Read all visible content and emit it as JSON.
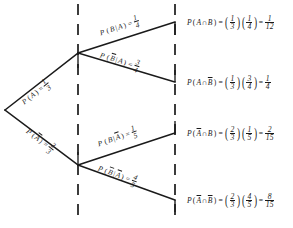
{
  "diagram": {
    "type": "probability-tree",
    "stroke_color": "#1a1a1a",
    "background": "#ffffff",
    "dashed_guides": [
      78,
      175
    ],
    "root": {
      "x": 5,
      "y": 110
    },
    "nodes": [
      {
        "id": "A",
        "x": 78,
        "y": 53
      },
      {
        "id": "Abar",
        "x": 78,
        "y": 165
      }
    ],
    "leaves": [
      {
        "id": "AB",
        "x": 175,
        "y": 22
      },
      {
        "id": "ABbar",
        "x": 175,
        "y": 82
      },
      {
        "id": "AbarB",
        "x": 175,
        "y": 133
      },
      {
        "id": "AbarBbar",
        "x": 175,
        "y": 200
      }
    ]
  },
  "branches": [
    {
      "name": "branch-a",
      "event": "P(A)",
      "event_symbol": "A",
      "complement": false,
      "conditional": false,
      "prob_num": "1",
      "prob_den": "3",
      "angle": -38
    },
    {
      "name": "branch-a-bar",
      "event": "P(Ā)",
      "event_symbol": "A",
      "complement": true,
      "conditional": false,
      "prob_num": "2",
      "prob_den": "3",
      "angle": 37
    },
    {
      "name": "branch-b-given-a",
      "event": "P(B|A)",
      "event_symbol": "B",
      "given": "A",
      "complement": false,
      "given_complement": false,
      "conditional": true,
      "prob_num": "1",
      "prob_den": "4",
      "angle": -18
    },
    {
      "name": "branch-b-bar-given-a",
      "event": "P(B̄|A)",
      "event_symbol": "B",
      "given": "A",
      "complement": true,
      "given_complement": false,
      "conditional": true,
      "prob_num": "3",
      "prob_den": "4",
      "angle": 17
    },
    {
      "name": "branch-b-given-a-bar",
      "event": "P(B|Ā)",
      "event_symbol": "B",
      "given": "A",
      "complement": false,
      "given_complement": true,
      "conditional": true,
      "prob_num": "1",
      "prob_den": "5",
      "angle": -19
    },
    {
      "name": "branch-b-bar-given-a-bar",
      "event": "P(B̄|Ā)",
      "event_symbol": "B",
      "given": "A",
      "complement": true,
      "given_complement": true,
      "conditional": true,
      "prob_num": "4",
      "prob_den": "5",
      "angle": 20
    }
  ],
  "outcomes": [
    {
      "name": "outcome-a-and-b",
      "label": "P(A ∩ B)",
      "first_symbol": "A",
      "first_complement": false,
      "second_symbol": "B",
      "second_complement": false,
      "factor1_num": "1",
      "factor1_den": "3",
      "factor2_num": "1",
      "factor2_den": "4",
      "result_num": "1",
      "result_den": "12",
      "y": 22
    },
    {
      "name": "outcome-a-and-b-bar",
      "label": "P(A ∩ B̄)",
      "first_symbol": "A",
      "first_complement": false,
      "second_symbol": "B",
      "second_complement": true,
      "factor1_num": "1",
      "factor1_den": "3",
      "factor2_num": "3",
      "factor2_den": "4",
      "result_num": "1",
      "result_den": "4",
      "y": 82
    },
    {
      "name": "outcome-a-bar-and-b",
      "label": "P(Ā ∩ B)",
      "first_symbol": "A",
      "first_complement": true,
      "second_symbol": "B",
      "second_complement": false,
      "factor1_num": "2",
      "factor1_den": "3",
      "factor2_num": "1",
      "factor2_den": "5",
      "result_num": "2",
      "result_den": "15",
      "y": 133
    },
    {
      "name": "outcome-a-bar-and-b-bar",
      "label": "P(Ā ∩ B̄)",
      "first_symbol": "A",
      "first_complement": true,
      "second_symbol": "B",
      "second_complement": true,
      "factor1_num": "2",
      "factor1_den": "3",
      "factor2_num": "4",
      "factor2_den": "5",
      "result_num": "8",
      "result_den": "15",
      "y": 200
    }
  ],
  "symbols": {
    "p": "P",
    "open_paren": "(",
    "close_paren": ")",
    "bar": "|",
    "cap": "∩",
    "equals": "="
  }
}
